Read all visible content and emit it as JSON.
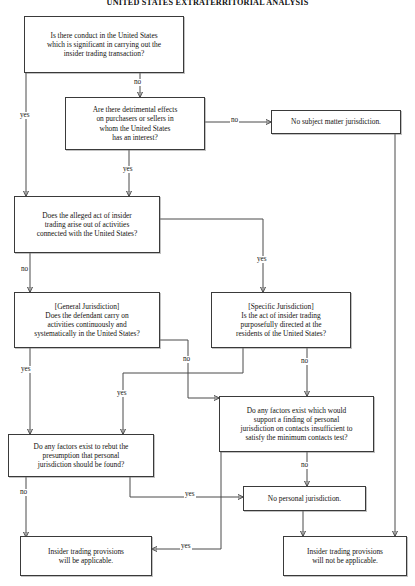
{
  "title": "UNITED STATES EXTRATERRITORIAL ANALYSIS",
  "diagram": {
    "type": "flowchart",
    "nodes": [
      {
        "id": "conduct",
        "label": "Is there conduct in the United States\nwhich is significant in carrying out the\ninsider trading transaction?",
        "kind": "decision"
      },
      {
        "id": "effects",
        "label": "Are there detrimental effects\non purchasers or sellers in\nwhom the United States\nhas an interest?",
        "kind": "decision"
      },
      {
        "id": "no-smj",
        "label": "No subject matter jurisdiction.",
        "kind": "outcome"
      },
      {
        "id": "arise",
        "label": "Does the alleged act of insider\ntrading arise out of activities\nconnected with the United States?",
        "kind": "decision"
      },
      {
        "id": "general",
        "label": "[General Jurisdiction]\nDoes the defendant carry on\nactivities continuously and\nsystematically in the United States?",
        "kind": "decision"
      },
      {
        "id": "specific",
        "label": "[Specific Jurisdiction]\nIs the act of insider trading\npurposefully directed at the\nresidents of the United States?",
        "kind": "decision"
      },
      {
        "id": "rebut",
        "label": "Do any factors exist to rebut the\npresumption that personal\njurisdiction should be found?",
        "kind": "decision"
      },
      {
        "id": "factors",
        "label": "Do any factors exist which would\nsupport a finding of personal\njurisdiction on contacts insufficient to\nsatisfy the minimum contacts test?",
        "kind": "decision"
      },
      {
        "id": "no-pj",
        "label": "No personal jurisdiction.",
        "kind": "outcome"
      },
      {
        "id": "applicable",
        "label": "Insider trading provisions\nwill be applicable.",
        "kind": "outcome"
      },
      {
        "id": "not-applicable",
        "label": "Insider trading provisions\nwill not be applicable.",
        "kind": "outcome"
      }
    ],
    "edges": [
      {
        "from": "conduct",
        "to": "arise",
        "label": "yes"
      },
      {
        "from": "conduct",
        "to": "effects",
        "label": "no"
      },
      {
        "from": "effects",
        "to": "no-smj",
        "label": "no"
      },
      {
        "from": "effects",
        "to": "arise",
        "label": "yes"
      },
      {
        "from": "no-smj",
        "to": "not-applicable",
        "label": ""
      },
      {
        "from": "arise",
        "to": "general",
        "label": "no"
      },
      {
        "from": "arise",
        "to": "specific",
        "label": "yes"
      },
      {
        "from": "general",
        "to": "rebut",
        "label": "yes"
      },
      {
        "from": "general",
        "to": "factors",
        "label": "no"
      },
      {
        "from": "specific",
        "to": "rebut",
        "label": "yes"
      },
      {
        "from": "specific",
        "to": "factors",
        "label": "no"
      },
      {
        "from": "rebut",
        "to": "applicable",
        "label": "no"
      },
      {
        "from": "rebut",
        "to": "no-pj",
        "label": "yes"
      },
      {
        "from": "factors",
        "to": "no-pj",
        "label": "no"
      },
      {
        "from": "factors",
        "to": "applicable",
        "label": "yes"
      },
      {
        "from": "no-pj",
        "to": "not-applicable",
        "label": ""
      }
    ],
    "edge_labels": {
      "conduct_yes": "yes",
      "conduct_no": "no",
      "effects_no": "no",
      "effects_yes": "yes",
      "arise_no": "no",
      "arise_yes": "yes",
      "general_yes": "yes",
      "general_no": "no",
      "specific_yes": "yes",
      "specific_no": "no",
      "rebut_no": "no",
      "rebut_yes": "yes",
      "factors_no": "no",
      "factors_yes": "yes"
    }
  }
}
